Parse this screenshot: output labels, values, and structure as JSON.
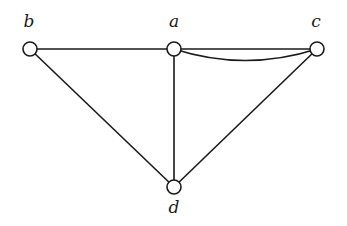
{
  "graph": {
    "nodes": [
      {
        "id": "b",
        "label": "b",
        "x": 30,
        "y": 49,
        "label_x": 29,
        "label_y": 11
      },
      {
        "id": "a",
        "label": "a",
        "x": 174,
        "y": 49,
        "label_x": 174,
        "label_y": 11
      },
      {
        "id": "c",
        "label": "c",
        "x": 317,
        "y": 49,
        "label_x": 316,
        "label_y": 11
      },
      {
        "id": "d",
        "label": "d",
        "x": 174,
        "y": 187,
        "label_x": 174,
        "label_y": 197
      }
    ],
    "edges": [
      {
        "from": "b",
        "to": "a",
        "type": "straight"
      },
      {
        "from": "a",
        "to": "c",
        "type": "straight"
      },
      {
        "from": "a",
        "to": "c",
        "type": "curved"
      },
      {
        "from": "b",
        "to": "d",
        "type": "straight"
      },
      {
        "from": "a",
        "to": "d",
        "type": "straight"
      },
      {
        "from": "c",
        "to": "d",
        "type": "straight"
      }
    ],
    "colors": {
      "stroke": "#1a1a1a",
      "node_fill": "#ffffff"
    }
  }
}
